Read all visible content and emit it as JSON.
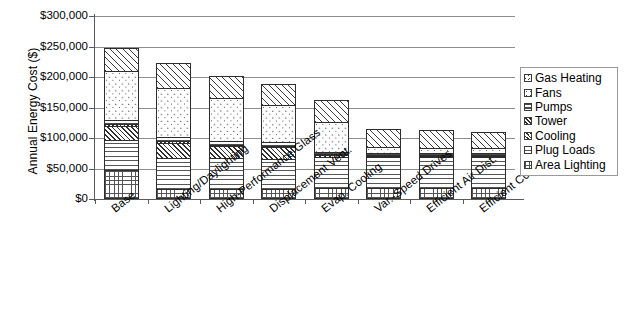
{
  "chart_data": {
    "type": "bar",
    "title": "",
    "subtitle": "",
    "xlabel": "",
    "ylabel": "Annual Energy Cost ($)",
    "stacked": true,
    "grid": true,
    "legend_position": "right",
    "ylim": [
      0,
      300000
    ],
    "ytick_values": [
      0,
      50000,
      100000,
      150000,
      200000,
      250000,
      300000
    ],
    "ytick_labels": [
      "$0",
      "$50,000",
      "$100,000",
      "$150,000",
      "$200,000",
      "$250,000",
      "$300,000"
    ],
    "categories": [
      "Base",
      "Lighting/Daylighting",
      "High-Performance Glass",
      "Displacement Vent.",
      "Evap. Cooling",
      "Var.-Speed Drives",
      "Efficient Air Dist.",
      "Efficient Cooling"
    ],
    "series": [
      {
        "name": "Area Lighting",
        "pattern": "grid-crosshatch",
        "values": [
          47000,
          17000,
          17000,
          16000,
          18000,
          18000,
          18000,
          18000
        ]
      },
      {
        "name": "Plug Loads",
        "pattern": "horizontal-lines",
        "values": [
          52000,
          52000,
          52000,
          52000,
          52000,
          52000,
          52000,
          52000
        ]
      },
      {
        "name": "Cooling",
        "pattern": "diagonal-hatch-dense",
        "values": [
          24000,
          26000,
          21000,
          20000,
          5000,
          4000,
          4000,
          4000
        ]
      },
      {
        "name": "Tower",
        "pattern": "diagonal-hatch-fine",
        "values": [
          5000,
          5000,
          4000,
          4000,
          4000,
          3000,
          3000,
          3000
        ]
      },
      {
        "name": "Pumps",
        "pattern": "horizontal-thin-lines",
        "values": [
          8000,
          8000,
          8000,
          8000,
          5000,
          4000,
          4000,
          4000
        ]
      },
      {
        "name": "Fans",
        "pattern": "dots",
        "values": [
          82000,
          82000,
          72000,
          63000,
          51000,
          12000,
          10000,
          10000
        ]
      },
      {
        "name": "Gas Heating",
        "pattern": "diagonal-hatch-wide",
        "values": [
          40000,
          43000,
          37000,
          35000,
          37000,
          32000,
          31000,
          29000
        ]
      }
    ],
    "totals": [
      258000,
      233000,
      211000,
      198000,
      172000,
      125000,
      122000,
      120000
    ]
  },
  "legend": {
    "items": [
      {
        "label": "Gas Heating"
      },
      {
        "label": "Fans"
      },
      {
        "label": "Pumps"
      },
      {
        "label": "Tower"
      },
      {
        "label": "Cooling"
      },
      {
        "label": "Plug Loads"
      },
      {
        "label": "Area Lighting"
      }
    ]
  }
}
